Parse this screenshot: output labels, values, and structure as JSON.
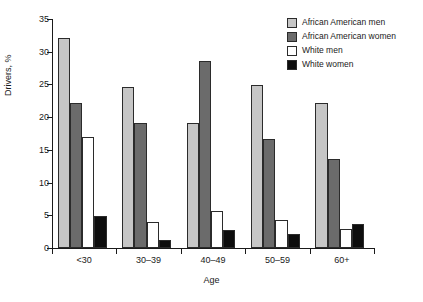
{
  "chart_data": {
    "type": "bar",
    "title": "",
    "xlabel": "Age",
    "ylabel": "Drivers, %",
    "categories": [
      "<30",
      "30–39",
      "40–49",
      "50–59",
      "60+"
    ],
    "series": [
      {
        "name": "African American men",
        "color": "#c6c6c6",
        "values": [
          32.1,
          24.6,
          19.1,
          24.9,
          22.1
        ]
      },
      {
        "name": "African American women",
        "color": "#6b6b6b",
        "values": [
          22.2,
          19.1,
          28.6,
          16.7,
          13.6
        ]
      },
      {
        "name": "White men",
        "color": "#ffffff",
        "values": [
          17.0,
          3.9,
          5.7,
          4.3,
          2.9
        ]
      },
      {
        "name": "White women",
        "color": "#0d0d0d",
        "values": [
          4.9,
          1.3,
          2.8,
          2.1,
          3.7
        ]
      }
    ],
    "ylim": [
      0,
      35
    ],
    "yticks": [
      0,
      5,
      10,
      15,
      20,
      25,
      30,
      35
    ],
    "ytick_labels": [
      "0",
      "5",
      "10",
      "15",
      "20",
      "25",
      "30",
      "35"
    ],
    "grid": false,
    "legend_position": "top-right",
    "bar_outline_color": "#2b2b2b",
    "axis_color": "#1a1a1a",
    "background": "#ffffff"
  }
}
